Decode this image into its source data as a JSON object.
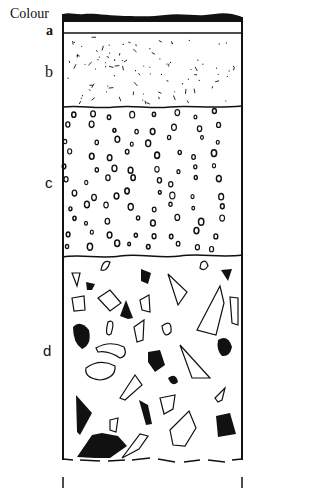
{
  "diagram": {
    "type": "soil-profile",
    "header_label": "Colour",
    "layers": [
      {
        "id": "a",
        "label": "a",
        "texture": "thin band"
      },
      {
        "id": "b",
        "label": "b",
        "texture": "fine particles"
      },
      {
        "id": "c",
        "label": "c",
        "texture": "small rounded pebbles"
      },
      {
        "id": "d",
        "label": "d",
        "texture": "large angular and rounded stones"
      }
    ],
    "colors": {
      "ink": "#111111",
      "background": "#ffffff"
    }
  }
}
